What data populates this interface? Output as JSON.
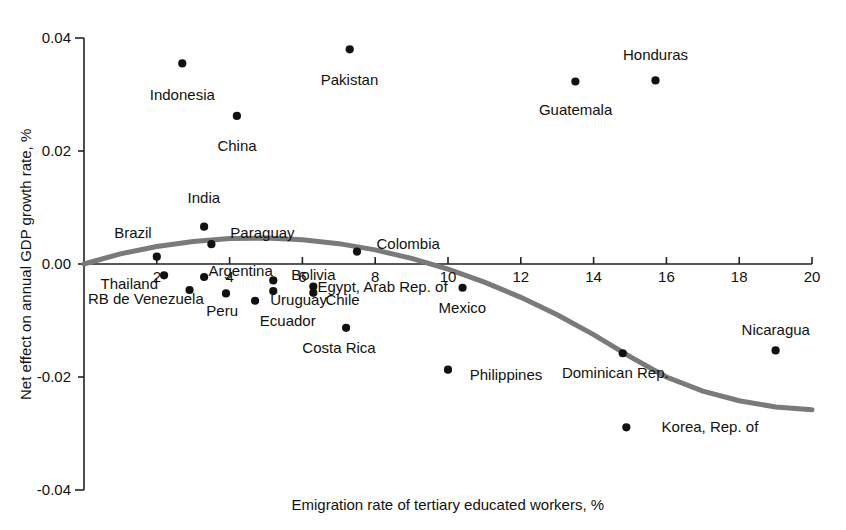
{
  "chart_data": {
    "type": "scatter",
    "title": "",
    "xlabel": "Emigration rate of tertiary educated workers, %",
    "ylabel": "Net effect on annual GDP growth rate, %",
    "xlim": [
      0,
      20
    ],
    "ylim": [
      -0.04,
      0.04
    ],
    "xticks": [
      2,
      4,
      6,
      8,
      10,
      12,
      14,
      16,
      18,
      20
    ],
    "xtick_labels": [
      "2",
      "4",
      "6",
      "8",
      "10",
      "12",
      "14",
      "16",
      "18",
      "20"
    ],
    "yticks": [
      -0.04,
      -0.02,
      0.0,
      0.02,
      0.04
    ],
    "ytick_labels": [
      "-0.04",
      "-0.02",
      "0.00",
      "0.02",
      "0.04"
    ],
    "grid": false,
    "legend": "none",
    "marker_color": "#111111",
    "curve_color": "#7a7a7a",
    "points": [
      {
        "label": "Indonesia",
        "x": 2.7,
        "y": 0.0355,
        "lx": 2.7,
        "ly": 0.03,
        "anchor": "middle"
      },
      {
        "label": "Pakistan",
        "x": 7.3,
        "y": 0.038,
        "lx": 7.3,
        "ly": 0.0325,
        "anchor": "middle"
      },
      {
        "label": "Honduras",
        "x": 15.7,
        "y": 0.0325,
        "lx": 15.7,
        "ly": 0.037,
        "anchor": "middle"
      },
      {
        "label": "Guatemala",
        "x": 13.5,
        "y": 0.0323,
        "lx": 13.5,
        "ly": 0.0272,
        "anchor": "middle"
      },
      {
        "label": "China",
        "x": 4.2,
        "y": 0.0262,
        "lx": 4.2,
        "ly": 0.0208,
        "anchor": "middle"
      },
      {
        "label": "India",
        "x": 3.3,
        "y": 0.0066,
        "lx": 3.3,
        "ly": 0.0116,
        "anchor": "middle"
      },
      {
        "label": "Brazil",
        "x": 2.0,
        "y": 0.0013,
        "lx": 1.35,
        "ly": 0.0055,
        "anchor": "middle"
      },
      {
        "label": "Paraguay",
        "x": 3.5,
        "y": 0.0035,
        "lx": 4.9,
        "ly": 0.0054,
        "anchor": "middle"
      },
      {
        "label": "Colombia",
        "x": 7.5,
        "y": 0.0022,
        "lx": 8.9,
        "ly": 0.0036,
        "anchor": "middle"
      },
      {
        "label": "Thailand",
        "x": 2.2,
        "y": -0.002,
        "lx": 1.25,
        "ly": -0.0035,
        "anchor": "middle"
      },
      {
        "label": "Argentina",
        "x": 3.3,
        "y": -0.0023,
        "lx": 4.3,
        "ly": -0.0013,
        "anchor": "middle"
      },
      {
        "label": "Bolivia",
        "x": 5.2,
        "y": -0.0029,
        "lx": 6.3,
        "ly": -0.002,
        "anchor": "middle"
      },
      {
        "label": "RB de Venezuela",
        "x": 2.9,
        "y": -0.0046,
        "lx": 1.7,
        "ly": -0.0062,
        "anchor": "middle"
      },
      {
        "label": "Peru",
        "x": 3.9,
        "y": -0.0052,
        "lx": 3.8,
        "ly": -0.0083,
        "anchor": "middle"
      },
      {
        "label": "Uruguay",
        "x": 4.7,
        "y": -0.0065,
        "lx": 5.9,
        "ly": -0.0063,
        "anchor": "middle"
      },
      {
        "label": "Ecuador",
        "x": 5.2,
        "y": -0.0048,
        "lx": 5.6,
        "ly": -0.01,
        "anchor": "middle"
      },
      {
        "label": "Egypt, Arab Rep. of",
        "x": 6.3,
        "y": -0.004,
        "lx": 8.2,
        "ly": -0.004,
        "anchor": "middle"
      },
      {
        "label": "Chile",
        "x": 6.3,
        "y": -0.0051,
        "lx": 7.1,
        "ly": -0.0064,
        "anchor": "middle"
      },
      {
        "label": "Mexico",
        "x": 10.4,
        "y": -0.0042,
        "lx": 10.4,
        "ly": -0.0077,
        "anchor": "middle"
      },
      {
        "label": "Costa Rica",
        "x": 7.2,
        "y": -0.0113,
        "lx": 7.0,
        "ly": -0.0148,
        "anchor": "middle"
      },
      {
        "label": "Philippines",
        "x": 10.0,
        "y": -0.0187,
        "lx": 11.6,
        "ly": -0.0196,
        "anchor": "middle"
      },
      {
        "label": "Dominican Rep.",
        "x": 14.8,
        "y": -0.0158,
        "lx": 14.6,
        "ly": -0.0193,
        "anchor": "middle"
      },
      {
        "label": "Nicaragua",
        "x": 19.0,
        "y": -0.0153,
        "lx": 19.0,
        "ly": -0.0116,
        "anchor": "middle"
      },
      {
        "label": "Korea, Rep. of",
        "x": 14.9,
        "y": -0.0289,
        "lx": 17.2,
        "ly": -0.0289,
        "anchor": "middle"
      }
    ],
    "fit_curve": {
      "name": "quadratic fit",
      "x": [
        0.0,
        1.0,
        2.0,
        3.0,
        4.0,
        5.0,
        6.0,
        7.0,
        8.0,
        9.0,
        10.0,
        11.0,
        12.0,
        13.0,
        14.0,
        15.0,
        16.0,
        17.0,
        18.0,
        19.0,
        20.0
      ],
      "y": [
        0.0,
        0.0018,
        0.0031,
        0.004,
        0.0045,
        0.0046,
        0.0043,
        0.0036,
        0.0025,
        0.001,
        -0.0009,
        -0.0032,
        -0.0059,
        -0.009,
        -0.0125,
        -0.0164,
        -0.02,
        -0.0225,
        -0.0242,
        -0.0253,
        -0.0258
      ]
    }
  }
}
